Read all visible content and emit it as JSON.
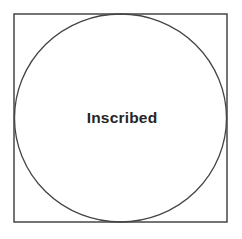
{
  "figure": {
    "kind": "geometry-diagram",
    "background_color": "#ffffff",
    "canvas": {
      "width": 242,
      "height": 239
    },
    "square": {
      "name": "outer-square",
      "x": 14,
      "y": 14,
      "width": 213,
      "height": 208,
      "stroke_color": "#3a3a3a",
      "stroke_width": 1.4,
      "fill": "none"
    },
    "circle": {
      "name": "inscribed-circle",
      "cx": 120.5,
      "cy": 118,
      "rx": 106,
      "ry": 104,
      "stroke_color": "#444444",
      "stroke_width": 1.3,
      "fill": "none"
    },
    "label": {
      "text": "Inscribed",
      "color": "#262626",
      "font_size_px": 15.5,
      "bold": true,
      "center_x": 122,
      "center_y": 120
    }
  }
}
